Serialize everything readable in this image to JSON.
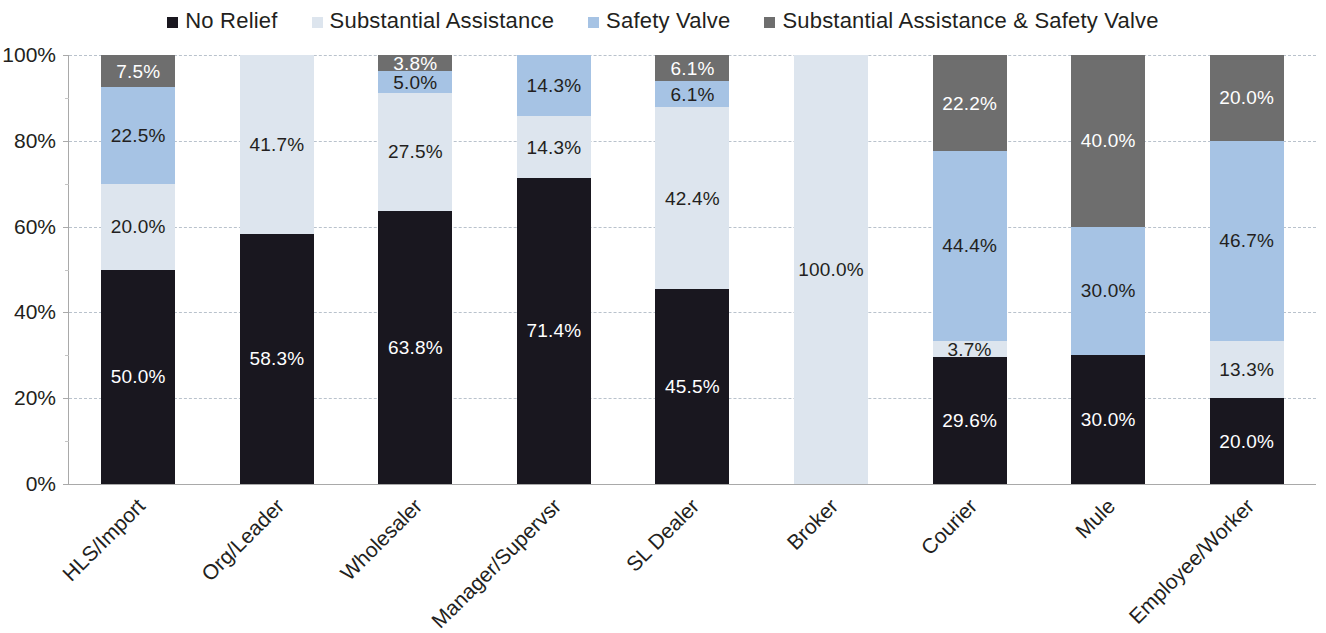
{
  "legend": {
    "items": [
      {
        "label": "No Relief",
        "color": "#19171f",
        "icon": "square-swatch-icon"
      },
      {
        "label": "Substantial Assistance",
        "color": "#dde5ee",
        "icon": "square-swatch-icon"
      },
      {
        "label": "Safety Valve",
        "color": "#a6c3e4",
        "icon": "square-swatch-icon"
      },
      {
        "label": "Substantial Assistance & Safety Valve",
        "color": "#6e6e6e",
        "icon": "square-swatch-icon"
      }
    ]
  },
  "axis": {
    "y_ticks": [
      "0%",
      "20%",
      "40%",
      "60%",
      "80%",
      "100%"
    ]
  },
  "chart_data": {
    "type": "bar",
    "stacked": true,
    "stack_mode": "percent",
    "title": "",
    "xlabel": "",
    "ylabel": "",
    "ylim": [
      0,
      100
    ],
    "ytick_labels": [
      "0%",
      "20%",
      "40%",
      "60%",
      "80%",
      "100%"
    ],
    "ytick_values": [
      0,
      20,
      40,
      60,
      80,
      100
    ],
    "grid": true,
    "legend_position": "top",
    "categories": [
      "HLS/Import",
      "Org/Leader",
      "Wholesaler",
      "Manager/Supervsr",
      "SL Dealer",
      "Broker",
      "Courier",
      "Mule",
      "Employee/Worker"
    ],
    "series": [
      {
        "name": "No Relief",
        "color": "#19171f",
        "label_color": "light",
        "values": [
          50.0,
          58.3,
          63.8,
          71.4,
          45.5,
          0.0,
          29.6,
          30.0,
          20.0
        ],
        "labels": [
          "50.0%",
          "58.3%",
          "63.8%",
          "71.4%",
          "45.5%",
          "",
          "29.6%",
          "30.0%",
          "20.0%"
        ]
      },
      {
        "name": "Substantial Assistance",
        "color": "#dde5ee",
        "label_color": "dark",
        "values": [
          20.0,
          41.7,
          27.5,
          14.3,
          42.4,
          100.0,
          3.7,
          0.0,
          13.3
        ],
        "labels": [
          "20.0%",
          "41.7%",
          "27.5%",
          "14.3%",
          "42.4%",
          "100.0%",
          "3.7%",
          "",
          "13.3%"
        ]
      },
      {
        "name": "Safety Valve",
        "color": "#a6c3e4",
        "label_color": "dark",
        "values": [
          22.5,
          0.0,
          5.0,
          14.3,
          6.1,
          0.0,
          44.4,
          30.0,
          46.7
        ],
        "labels": [
          "22.5%",
          "",
          "5.0%",
          "14.3%",
          "6.1%",
          "",
          "44.4%",
          "30.0%",
          "46.7%"
        ]
      },
      {
        "name": "Substantial Assistance & Safety Valve",
        "color": "#6e6e6e",
        "label_color": "light",
        "values": [
          7.5,
          0.0,
          3.8,
          0.0,
          6.1,
          0.0,
          22.2,
          40.0,
          20.0
        ],
        "labels": [
          "7.5%",
          "",
          "3.8%",
          "",
          "6.1%",
          "",
          "22.2%",
          "40.0%",
          "20.0%"
        ]
      }
    ]
  }
}
